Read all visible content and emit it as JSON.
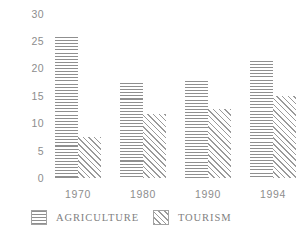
{
  "chart_data": {
    "type": "bar",
    "title": "",
    "subtitle": "",
    "xlabel": "",
    "ylabel": "",
    "categories": [
      "1970",
      "1980",
      "1990",
      "1994"
    ],
    "series": [
      {
        "name": "AGRICULTURE",
        "values": [
          25.5,
          17.2,
          17.5,
          21.2
        ]
      },
      {
        "name": "TOURISM",
        "values": [
          7.5,
          11.5,
          12.4,
          14.8
        ]
      }
    ],
    "ylim": [
      0,
      30
    ],
    "ytick_labels": [
      "30",
      "25",
      "20",
      "15",
      "10",
      "5",
      "0"
    ],
    "ytick_values": [
      30,
      25,
      20,
      15,
      10,
      5,
      0
    ],
    "grid": false,
    "legend_position": "bottom",
    "legend": [
      {
        "label": "AGRICULTURE",
        "pattern": "horizontal-hatch"
      },
      {
        "label": "TOURISM",
        "pattern": "diagonal-hatch"
      }
    ],
    "colors": {
      "background": "#ffffff",
      "hatch_agriculture": "#8f8f8f",
      "hatch_tourism": "#9a9a9a",
      "text": "#8d8d8d"
    }
  }
}
